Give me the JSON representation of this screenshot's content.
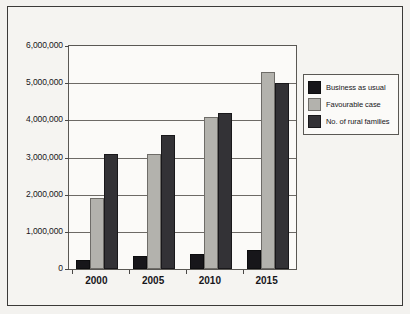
{
  "chart_data": {
    "type": "bar",
    "title": "",
    "xlabel": "",
    "ylabel": "",
    "categories": [
      "2000",
      "2005",
      "2010",
      "2015"
    ],
    "series": [
      {
        "name": "Business as usual",
        "values": [
          250000,
          350000,
          400000,
          500000
        ],
        "color": "#17161a"
      },
      {
        "name": "Favourable case",
        "values": [
          1900000,
          3100000,
          4100000,
          5300000
        ],
        "color": "#b3b2ad"
      },
      {
        "name": "No. of rural families",
        "values": [
          3100000,
          3600000,
          4200000,
          5000000
        ],
        "color": "#333236"
      }
    ],
    "ylim": [
      0,
      6000000
    ],
    "ytick_values": [
      0,
      1000000,
      2000000,
      3000000,
      4000000,
      5000000,
      6000000
    ],
    "ytick_labels": [
      "0",
      "1,000,000",
      "2,000,000",
      "3,000,000",
      "4,000,000",
      "5,000,000",
      "6,000,000"
    ],
    "grid": true,
    "legend_position": "right"
  },
  "legend": {
    "items": [
      {
        "label": "Business as usual"
      },
      {
        "label": "Favourable case"
      },
      {
        "label": "No. of rural families"
      }
    ]
  }
}
